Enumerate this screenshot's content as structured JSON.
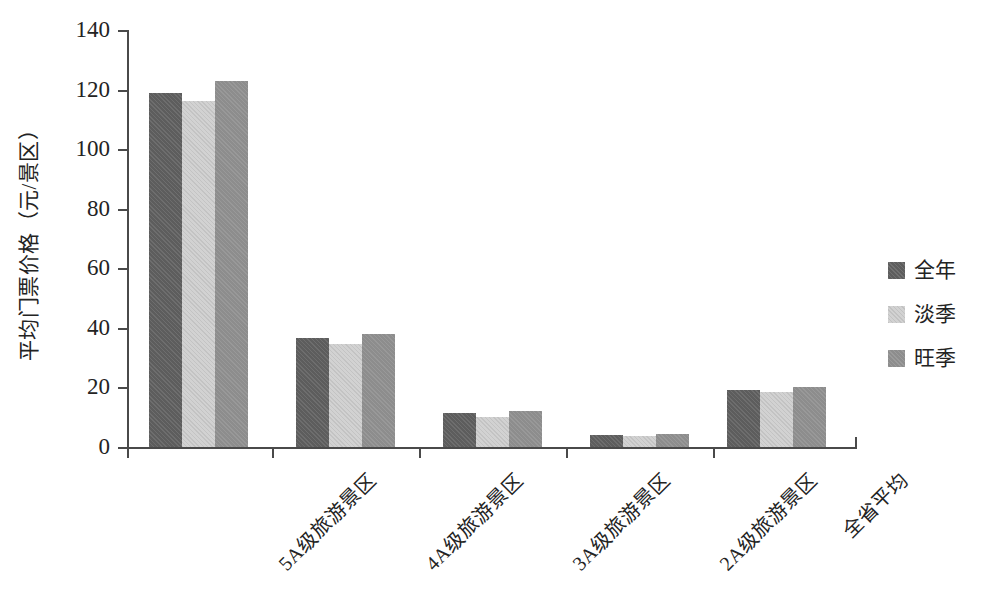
{
  "chart_data": {
    "type": "bar",
    "title": "",
    "subtitle": "",
    "xlabel": "",
    "ylabel": "平均门票价格（元/景区）",
    "ylim": [
      0,
      140
    ],
    "ytick_values": [
      0,
      20,
      40,
      60,
      80,
      100,
      120,
      140
    ],
    "ytick_labels": [
      "0",
      "20",
      "40",
      "60",
      "80",
      "100",
      "120",
      "140"
    ],
    "grid": false,
    "legend_position": "right",
    "categories": [
      "5A级旅游景区",
      "4A级旅游景区",
      "3A级旅游景区",
      "2A级旅游景区",
      "全省平均"
    ],
    "series": [
      {
        "name": "全年",
        "color": "#5d5d5d",
        "values": [
          119,
          36.5,
          11.3,
          4.0,
          19.3
        ]
      },
      {
        "name": "淡季",
        "color": "#d2d2d2",
        "values": [
          116,
          34.5,
          10.2,
          3.8,
          18.3
        ]
      },
      {
        "name": "旺季",
        "color": "#8d8d8d",
        "values": [
          123,
          38.0,
          12.2,
          4.4,
          20.2
        ]
      }
    ],
    "annotations": []
  },
  "axis": {
    "y_title": "平均门票价格（元/景区）",
    "axis_color": "#4a4a4a"
  },
  "legend": {
    "items": [
      {
        "label": "全年"
      },
      {
        "label": "淡季"
      },
      {
        "label": "旺季"
      }
    ]
  }
}
